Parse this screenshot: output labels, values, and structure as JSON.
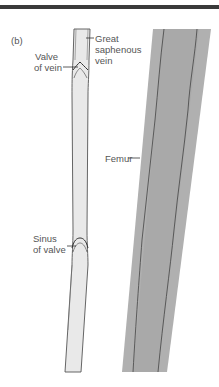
{
  "figure": {
    "panel_label": "(b)",
    "labels": {
      "great_saphenous_vein": [
        "Great",
        "saphenous",
        "vein"
      ],
      "valve_of_vein": [
        "Valve",
        "of vein"
      ],
      "femur": "Femur",
      "sinus_of_valve": [
        "Sinus",
        "of valve"
      ]
    },
    "colors": {
      "top_bar": "#3a3a3a",
      "vein_fill": "#e9e9e9",
      "vein_outline": "#555555",
      "femur_fill": "#b0b0b0",
      "femur_inner": "#a6a6a6",
      "femur_line": "#444444",
      "label_text": "#555555"
    }
  }
}
